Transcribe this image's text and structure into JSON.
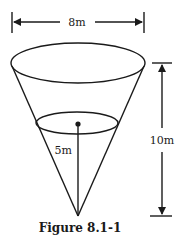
{
  "figure": {
    "caption": "Figure 8.1-1",
    "shape": "inverted cone",
    "dimensions": {
      "top_diameter_label": "8m",
      "height_label": "10m",
      "water_depth_label": "5m"
    },
    "colors": {
      "stroke": "#1a1a1a",
      "background": "#ffffff"
    }
  }
}
